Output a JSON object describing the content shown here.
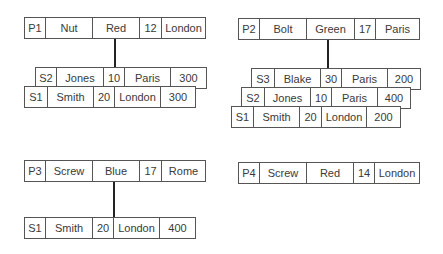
{
  "groups": [
    {
      "part": {
        "cells": [
          "P1",
          "Nut",
          "Red",
          "12",
          "London"
        ]
      },
      "suppliers": [
        {
          "cells": [
            "S2",
            "Jones",
            "10",
            "Paris",
            "300"
          ]
        },
        {
          "cells": [
            "S1",
            "Smith",
            "20",
            "London",
            "300"
          ]
        }
      ]
    },
    {
      "part": {
        "cells": [
          "P2",
          "Bolt",
          "Green",
          "17",
          "Paris"
        ]
      },
      "suppliers": [
        {
          "cells": [
            "S3",
            "Blake",
            "30",
            "Paris",
            "200"
          ]
        },
        {
          "cells": [
            "S2",
            "Jones",
            "10",
            "Paris",
            "400"
          ]
        },
        {
          "cells": [
            "S1",
            "Smith",
            "20",
            "London",
            "200"
          ]
        }
      ]
    },
    {
      "part": {
        "cells": [
          "P3",
          "Screw",
          "Blue",
          "17",
          "Rome"
        ]
      },
      "suppliers": [
        {
          "cells": [
            "S1",
            "Smith",
            "20",
            "London",
            "400"
          ]
        }
      ]
    },
    {
      "part": {
        "cells": [
          "P4",
          "Screw",
          "Red",
          "14",
          "London"
        ]
      },
      "suppliers": []
    }
  ]
}
